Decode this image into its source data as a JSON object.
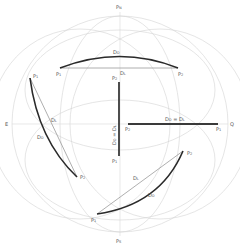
{
  "diagram": {
    "poles": {
      "north": "PN",
      "south": "PS",
      "east": "E",
      "equator_point": "Q"
    },
    "routes": [
      {
        "name": "top",
        "start": "P1",
        "end": "P2",
        "orthodrome_label": "DO",
        "loxodrome_label": "DL"
      },
      {
        "name": "meridian",
        "start": "P1",
        "end": "P2",
        "label": "DO = DL"
      },
      {
        "name": "equator",
        "start": "P2",
        "end": "P1",
        "label": "DO = DL"
      },
      {
        "name": "left",
        "start": "P1",
        "end": "P2",
        "orthodrome_label": "DO",
        "loxodrome_label": "DL"
      },
      {
        "name": "bottom",
        "start": "P1",
        "end": "P2",
        "orthodrome_label": "DO",
        "loxodrome_label": "DL"
      }
    ],
    "colors": {
      "grid": "#d4d4d4",
      "orthodrome": "#2a2a2a",
      "loxodrome": "#9a9a9a",
      "label": "#555555"
    }
  }
}
